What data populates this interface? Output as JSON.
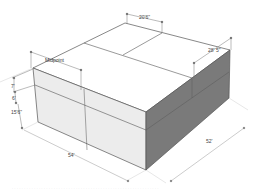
{
  "diagram": {
    "type": "isometric-box-dimension-drawing",
    "colors": {
      "background": "#ffffff",
      "top_face": "#ffffff",
      "front_face": "#ececec",
      "right_face": "#7a7a7a",
      "edge": "#555555",
      "dimension_line": "#888888"
    },
    "dimensions": {
      "top_width": "20'6\"",
      "top_right": "28' 5\"",
      "height_upper": "7'",
      "height_middle": "6'",
      "height_total": "15'6\"",
      "front_length": "54'",
      "side_length": "52'"
    },
    "annotations": {
      "midpoint_label": "Midpoint"
    },
    "caption": ". . . . . . . . . . . . . . . . . . . . . . . . . . . . . . . . . . . . . . . . . . . . . . . . . . . . . . . . . . . ."
  }
}
